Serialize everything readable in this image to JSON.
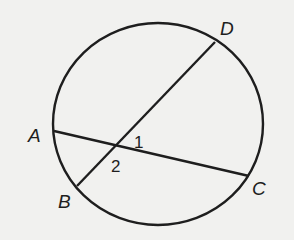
{
  "diagram": {
    "type": "circle-with-intersecting-chords",
    "stroke_color": "#1e1e1e",
    "background": "#f1f1ef",
    "circle": {
      "cx": 158,
      "cy": 124,
      "rx": 105,
      "ry": 101
    },
    "points": {
      "A": {
        "label": "A",
        "x": 54,
        "y": 131,
        "label_x": 28,
        "label_y": 142
      },
      "B": {
        "label": "B",
        "x": 77,
        "y": 186,
        "label_x": 58,
        "label_y": 208
      },
      "C": {
        "label": "C",
        "x": 249,
        "y": 176,
        "label_x": 252,
        "label_y": 195
      },
      "D": {
        "label": "D",
        "x": 215,
        "y": 42,
        "label_x": 220,
        "label_y": 35
      }
    },
    "chords": [
      {
        "name": "AC",
        "from": "A",
        "to": "C"
      },
      {
        "name": "BD",
        "from": "B",
        "to": "D"
      }
    ],
    "intersection": {
      "x": 115,
      "y": 146
    },
    "angles": [
      {
        "label": "1",
        "x": 134,
        "y": 148
      },
      {
        "label": "2",
        "x": 111,
        "y": 172
      }
    ]
  }
}
